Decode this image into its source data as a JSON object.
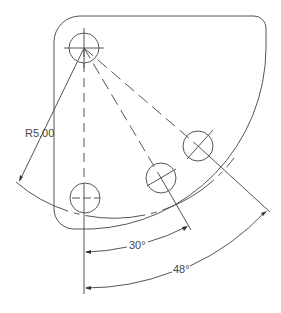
{
  "drawing": {
    "type": "mechanical-part-drawing",
    "dimensions": {
      "radius_label": "R5.00",
      "angle_small_label": "30°",
      "angle_large_label": "48°"
    },
    "holes_count": 4,
    "colors": {
      "line": "#555555",
      "background": "#ffffff"
    }
  }
}
